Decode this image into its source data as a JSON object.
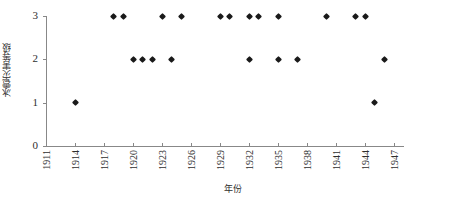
{
  "chart_data": {
    "type": "scatter",
    "title": "",
    "xlabel": "年份",
    "ylabel": "冰雹灾害等级",
    "xlim": [
      1911,
      1948
    ],
    "ylim": [
      0,
      3
    ],
    "xticks": [
      1911,
      1914,
      1917,
      1920,
      1923,
      1926,
      1929,
      1932,
      1935,
      1938,
      1941,
      1944,
      1947
    ],
    "xtick_labels": [
      "1911",
      "1914",
      "1917",
      "1920",
      "1923",
      "1926",
      "1929",
      "1932",
      "1935",
      "1938",
      "1941",
      "1944",
      "1947"
    ],
    "yticks": [
      0,
      1,
      2,
      3
    ],
    "ytick_labels": [
      "0",
      "1",
      "2",
      "3"
    ],
    "grid": false,
    "legend": false,
    "marker": "diamond",
    "marker_color": "#1a1a1a",
    "axis_color": "#888888",
    "background": "#ffffff",
    "points": [
      {
        "x": 1914,
        "y": 1
      },
      {
        "x": 1918,
        "y": 3
      },
      {
        "x": 1919,
        "y": 3
      },
      {
        "x": 1920,
        "y": 2
      },
      {
        "x": 1921,
        "y": 2
      },
      {
        "x": 1922,
        "y": 2
      },
      {
        "x": 1923,
        "y": 3
      },
      {
        "x": 1924,
        "y": 2
      },
      {
        "x": 1925,
        "y": 3
      },
      {
        "x": 1929,
        "y": 3
      },
      {
        "x": 1930,
        "y": 3
      },
      {
        "x": 1932,
        "y": 2
      },
      {
        "x": 1932,
        "y": 3
      },
      {
        "x": 1933,
        "y": 3
      },
      {
        "x": 1935,
        "y": 2
      },
      {
        "x": 1935,
        "y": 3
      },
      {
        "x": 1937,
        "y": 2
      },
      {
        "x": 1940,
        "y": 3
      },
      {
        "x": 1943,
        "y": 3
      },
      {
        "x": 1944,
        "y": 3
      },
      {
        "x": 1945,
        "y": 1
      },
      {
        "x": 1946,
        "y": 2
      }
    ]
  },
  "axis": {
    "y_title": "冰雹灾害等级",
    "x_title": "年份"
  },
  "caption": {
    "text": ""
  }
}
